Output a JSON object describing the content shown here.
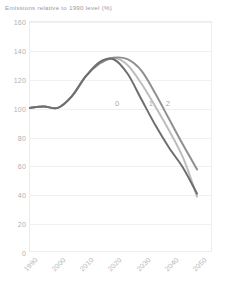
{
  "chart_data": {
    "type": "line",
    "title": "Emissions relative to 1990 level (%)",
    "xlabel": "",
    "ylabel": "",
    "xlim": [
      1990,
      2055
    ],
    "ylim": [
      0,
      160
    ],
    "grid": true,
    "legend_position": "inline-at-curve",
    "x_ticks": [
      "1990",
      "2000",
      "2010",
      "2020",
      "2030",
      "2040",
      "2050"
    ],
    "x_tick_values": [
      1990,
      2000,
      2010,
      2020,
      2030,
      2040,
      2050
    ],
    "y_ticks": [
      "0",
      "20",
      "40",
      "60",
      "80",
      "100",
      "120",
      "140",
      "160"
    ],
    "y_tick_values": [
      0,
      20,
      40,
      60,
      80,
      100,
      120,
      140,
      160
    ],
    "x": [
      1990,
      1995,
      2000,
      2005,
      2010,
      2015,
      2020,
      2025,
      2030,
      2035,
      2040,
      2045,
      2050
    ],
    "series": [
      {
        "name": "0",
        "label": "0",
        "color": "#6e6e6e",
        "label_x": 2021,
        "label_y": 104,
        "values": [
          100,
          101,
          100,
          108,
          122,
          132,
          134,
          124,
          106,
          88,
          72,
          58,
          40
        ]
      },
      {
        "name": "1",
        "label": "1",
        "color": "#bdbdbd",
        "label_x": 2033,
        "label_y": 104,
        "values": [
          100,
          101,
          100,
          108,
          122,
          131,
          135,
          130,
          117,
          101,
          84,
          65,
          38
        ]
      },
      {
        "name": "2",
        "label": "2",
        "color": "#8f8f8f",
        "label_x": 2039,
        "label_y": 104,
        "values": [
          100,
          101,
          100,
          108,
          122,
          131,
          135,
          134,
          126,
          110,
          92,
          74,
          57
        ]
      }
    ]
  }
}
